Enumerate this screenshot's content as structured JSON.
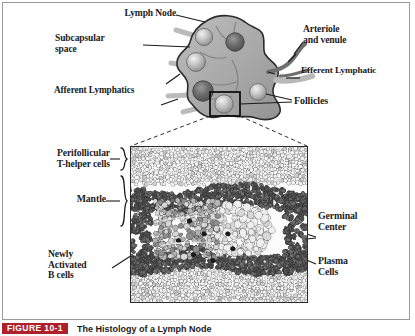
{
  "figure": {
    "caption_tag": "FIGURE 10-1",
    "caption_text": "The Histology of a Lymph Node",
    "tag_color": "#b0202a",
    "border_color": "#9a9a9a"
  },
  "top_diagram": {
    "title_hint": "lymph node cross section",
    "labels": {
      "lymph_node": "Lymph Node",
      "subcapsular_space": "Subcapsular\nspace",
      "afferent_lymphatics": "Afferent Lymphatics",
      "arteriole_and_venule": "Arteriole\nand venule",
      "efferent_lymphatic": "Efferent Lymphatic",
      "follicles": "Follicles"
    },
    "colors": {
      "node_fill": "#a9a9a9",
      "node_stroke": "#2c2c2c",
      "follicle_dark": "#6e6e6e",
      "follicle_light": "#c8c8c8",
      "vessel": "#7b7b7b"
    }
  },
  "micrograph": {
    "labels": {
      "perifollicular": "Perifollicular\nT-helper cells",
      "mantle": "Mantle",
      "newly_activated_b_cells": "Newly\nActivated\nB cells",
      "germinal_center": "Germinal\nCenter",
      "plasma_cells": "Plasma\nCells"
    },
    "zones": [
      {
        "name": "perifollicular T-helper cells",
        "band": "top",
        "cell_tone": "light-outline"
      },
      {
        "name": "mantle",
        "band": "middle-ring",
        "cell_tone": "dark-dense"
      },
      {
        "name": "germinal center",
        "band": "center",
        "cell_tone": "large-pale"
      },
      {
        "name": "plasma cells",
        "band": "center-right",
        "cell_tone": "pale-round"
      },
      {
        "name": "newly activated B cells",
        "band": "center-left",
        "cell_tone": "dark-nucleus"
      }
    ],
    "colors": {
      "frame": "#2b2b2b",
      "background": "#fcfcfc",
      "dark_cells": "#5a5a5a",
      "mid_cells": "#9b9b9b",
      "pale_cells": "#e3e3e3",
      "nucleus": "#1a1a1a"
    }
  }
}
